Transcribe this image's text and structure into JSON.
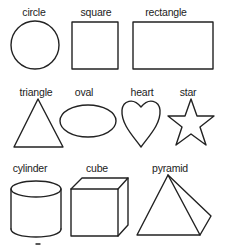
{
  "shapes": {
    "circle": {
      "label": "circle"
    },
    "square": {
      "label": "square"
    },
    "rectangle": {
      "label": "rectangle"
    },
    "triangle": {
      "label": "triangle"
    },
    "oval": {
      "label": "oval"
    },
    "heart": {
      "label": "heart"
    },
    "star": {
      "label": "star"
    },
    "cylinder": {
      "label": "cylinder"
    },
    "cube": {
      "label": "cube"
    },
    "pyramid": {
      "label": "pyramid"
    }
  },
  "colors": {
    "stroke": "#222222",
    "background": "#ffffff"
  }
}
